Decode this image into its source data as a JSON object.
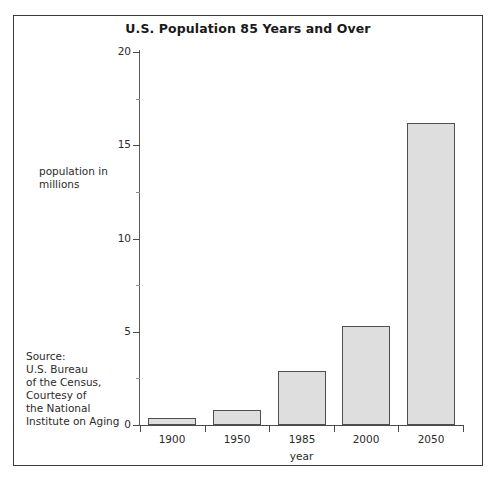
{
  "figure": {
    "title": "U.S. Population 85 Years and Over",
    "y_axis_caption": "population in millions",
    "source_note": "Source: U.S. Bureau of the Census, Courtesy of the National Institute on Aging",
    "source_lines": [
      "Source:",
      "U.S. Bureau",
      "of the Census,",
      "Courtesy of",
      "the National",
      "Institute on Aging"
    ],
    "y_caption_lines": [
      "population in",
      "millions"
    ],
    "bar_fill_color": "#dedede",
    "bar_edge_color": "#4f4f4f",
    "axis_color": "#4a4a4a",
    "background_color": "#ffffff"
  },
  "chart_data": {
    "type": "bar",
    "title": "U.S. Population 85 Years and Over",
    "xlabel": "year",
    "ylabel": "population in millions",
    "categories": [
      "1900",
      "1950",
      "1985",
      "2000",
      "2050"
    ],
    "values": [
      0.4,
      0.8,
      2.9,
      5.3,
      16.2
    ],
    "ylim": [
      0,
      20
    ],
    "yticks": [
      0,
      5,
      10,
      15,
      20
    ],
    "ytick_labels": [
      "0",
      "5",
      "10",
      "15",
      "20"
    ],
    "yminor_ticks": [
      2.5,
      7.5,
      12.5,
      17.5
    ],
    "grid": false,
    "legend": false,
    "annotations": [
      "Source: U.S. Bureau of the Census, Courtesy of the National Institute on Aging"
    ]
  }
}
